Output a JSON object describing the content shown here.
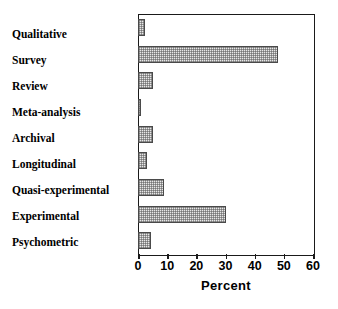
{
  "chart_data": {
    "type": "bar",
    "orientation": "horizontal",
    "title": "",
    "subtitle": "",
    "xlabel": "Percent",
    "ylabel": "",
    "categories": [
      "Qualitative",
      "Survey",
      "Review",
      "Meta-analysis",
      "Archival",
      "Longitudinal",
      "Quasi-experimental",
      "Experimental",
      "Psychometric"
    ],
    "values": [
      2.5,
      48,
      5,
      1,
      5,
      3,
      9,
      30,
      4.5
    ],
    "xlim": [
      0,
      60
    ],
    "ylim": null,
    "xticks": [
      0,
      10,
      20,
      30,
      40,
      50,
      60
    ],
    "xticklabels": [
      "0",
      "10",
      "20",
      "30",
      "40",
      "50",
      "60"
    ],
    "grid": false,
    "legend": null,
    "legend_position": "none",
    "annotations": [],
    "series": [
      {
        "name": "Percent",
        "values": [
          2.5,
          48,
          5,
          1,
          5,
          3,
          9,
          30,
          4.5
        ]
      }
    ],
    "colors": {
      "bar_fill": "#e8e8e8",
      "bar_hatch": "#5a5a5a",
      "bar_edge": "#4a4a4a",
      "axis": "#1a1a1a",
      "text": "#000000",
      "background": "#ffffff"
    }
  }
}
